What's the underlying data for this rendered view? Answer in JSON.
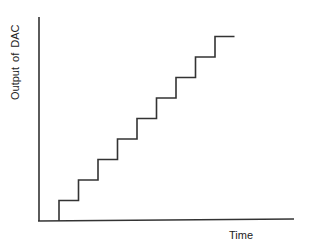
{
  "chart_data": {
    "type": "line",
    "title": "",
    "xlabel": "Time",
    "ylabel": "Output of DAC",
    "grid": false,
    "legend": null,
    "x": [
      0,
      1,
      2,
      3,
      4,
      5,
      6,
      7,
      8,
      9
    ],
    "values": [
      1,
      2,
      3,
      4,
      5,
      6,
      7,
      8,
      9,
      9
    ],
    "step": "post",
    "steps_count": 9,
    "xlim": [
      0,
      12.5
    ],
    "ylim": [
      0,
      9.5
    ]
  },
  "colors": {
    "line": "#333333",
    "axis": "#333333",
    "background": "#ffffff"
  }
}
